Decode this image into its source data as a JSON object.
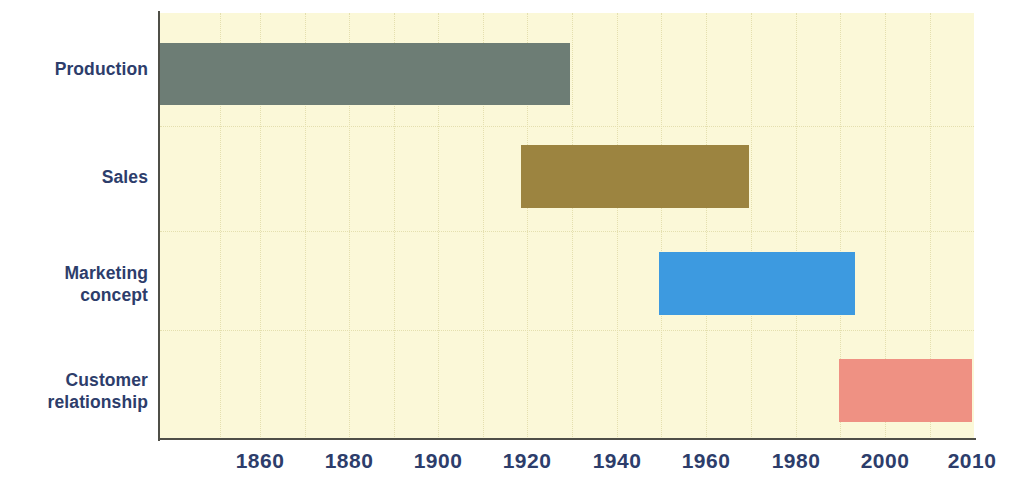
{
  "chart_data": {
    "type": "bar",
    "orientation": "horizontal",
    "title": "",
    "subtitle": "",
    "xlabel": "",
    "ylabel": "",
    "grid": true,
    "legend": false,
    "xlim": [
      1838,
      2010
    ],
    "xticks": [
      1860,
      1880,
      1900,
      1920,
      1940,
      1960,
      1980,
      2000,
      2010
    ],
    "xtick_labels": [
      "1860",
      "1880",
      "1900",
      "1920",
      "1940",
      "1960",
      "1980",
      "2000",
      "2010"
    ],
    "categories": [
      "Production",
      "Sales",
      "Marketing concept",
      "Customer relationship"
    ],
    "series": [
      {
        "name": "Era span",
        "bars": [
          {
            "category": "Production",
            "start": 1838,
            "end": 1930,
            "color": "#6d7d75"
          },
          {
            "category": "Sales",
            "start": 1919,
            "end": 1970,
            "color": "#9c8440"
          },
          {
            "category": "Marketing concept",
            "start": 1949,
            "end": 1993,
            "color": "#3d9ae0"
          },
          {
            "category": "Customer relationship",
            "start": 1990,
            "end": 2010,
            "color": "#ef9183"
          }
        ]
      }
    ],
    "colors": {
      "plot_background": "#fbf8d8",
      "page_background": "#ffffff",
      "axis": "#4f4f47",
      "grid": "#e4dfae",
      "label_text": "#2d3d6b"
    }
  },
  "axis": {
    "ticks": [
      {
        "label": "1860",
        "x": 260
      },
      {
        "label": "1880",
        "x": 349
      },
      {
        "label": "1900",
        "x": 438
      },
      {
        "label": "1920",
        "x": 527
      },
      {
        "label": "1940",
        "x": 617
      },
      {
        "label": "1960",
        "x": 706
      },
      {
        "label": "1980",
        "x": 796
      },
      {
        "label": "2000",
        "x": 885
      },
      {
        "label": "2010",
        "x": 972
      }
    ]
  },
  "categories": [
    {
      "label": "Production",
      "label_top": 58,
      "bar": {
        "left": 160,
        "top": 43,
        "width": 410,
        "height": 62,
        "color": "#6d7d75"
      }
    },
    {
      "label": "Sales",
      "label_top": 166,
      "bar": {
        "left": 521,
        "top": 145,
        "width": 228,
        "height": 63,
        "color": "#9c8440"
      }
    },
    {
      "label": "Marketing\nconcept",
      "label_top": 262,
      "bar": {
        "left": 659,
        "top": 252,
        "width": 196,
        "height": 63,
        "color": "#3d9ae0"
      }
    },
    {
      "label": "Customer\nrelationship",
      "label_top": 369,
      "bar": {
        "left": 839,
        "top": 359,
        "width": 133,
        "height": 63,
        "color": "#ef9183"
      }
    }
  ],
  "gridlines": {
    "vertical_x": [
      220,
      260,
      305,
      349,
      394,
      438,
      483,
      527,
      572,
      617,
      661,
      706,
      751,
      796,
      840,
      885,
      930
    ],
    "horizontal_y": [
      126,
      231,
      330
    ]
  }
}
